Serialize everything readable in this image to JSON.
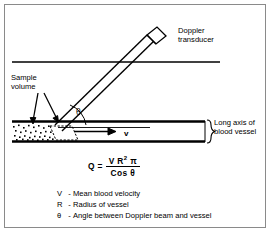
{
  "figure": {
    "title_alt": "Doppler ultrasound blood flow measurement diagram",
    "labels": {
      "transducer_line1": "Doppler",
      "transducer_line2": "transducer",
      "sample_line1": "Sample",
      "sample_line2": "volume",
      "long_axis_line1": "Long axis of",
      "long_axis_line2": "blood vessel",
      "theta": "θ",
      "velocity": "v"
    },
    "formula": {
      "lhs": "Q =",
      "numerator": "V R",
      "numerator_exponent": "2",
      "numerator_tail": "π",
      "denominator": "Cos θ"
    },
    "legend": [
      {
        "symbol": "V",
        "dash": "-",
        "text": "Mean blood velocity"
      },
      {
        "symbol": "R",
        "dash": "-",
        "text": "Radius of vessel"
      },
      {
        "symbol": "θ",
        "dash": "-",
        "text": "Angle between Doppler beam and vessel"
      }
    ],
    "colors": {
      "ink": "#000000",
      "frame": "#8a8a8a",
      "background": "#ffffff"
    }
  }
}
